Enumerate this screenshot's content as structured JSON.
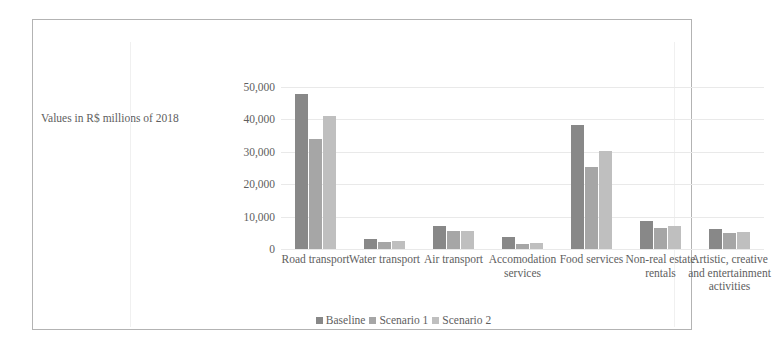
{
  "chart_data": {
    "type": "bar",
    "title": "",
    "xlabel": "",
    "ylabel": "Values in R$ millions of 2018",
    "ylim": [
      0,
      50000
    ],
    "yticks": [
      0,
      10000,
      20000,
      30000,
      40000,
      50000
    ],
    "ytick_labels": [
      "0",
      "10,000",
      "20,000",
      "30,000",
      "40,000",
      "50,000"
    ],
    "grid": true,
    "legend_position": "bottom",
    "categories": [
      "Road transport",
      "Water transport",
      "Air transport",
      "Accomodation services",
      "Food services",
      "Non-real estate rentals",
      "Artistic, creative and entertainment activities"
    ],
    "series": [
      {
        "name": "Baseline",
        "color": "#888888",
        "values": [
          47800,
          3000,
          7200,
          3700,
          38300,
          8600,
          6200
        ]
      },
      {
        "name": "Scenario 1",
        "color": "#a6a6a6",
        "values": [
          34000,
          2300,
          5600,
          1700,
          25300,
          6600,
          4800
        ]
      },
      {
        "name": "Scenario 2",
        "color": "#bfbfbf",
        "values": [
          41000,
          2500,
          5700,
          1800,
          30200,
          7000,
          5200
        ]
      }
    ]
  },
  "colors": {
    "frame": "#b3b3b3",
    "gridline": "#e9e9e9",
    "text": "#5e5e5e",
    "baseline": "#888888",
    "scenario1": "#a6a6a6",
    "scenario2": "#bfbfbf"
  }
}
